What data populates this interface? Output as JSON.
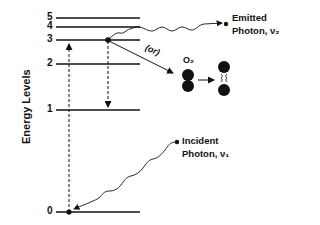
{
  "diagram": {
    "axis_label": "Energy Levels",
    "levels": [
      {
        "label": "5",
        "y": 18
      },
      {
        "label": "4",
        "y": 27
      },
      {
        "label": "3",
        "y": 40
      },
      {
        "label": "2",
        "y": 64
      },
      {
        "label": "1",
        "y": 110
      },
      {
        "label": "0",
        "y": 212
      }
    ],
    "emitted": {
      "line1": "Emitted",
      "line2": "Photon, ν₂"
    },
    "incident": {
      "line1": "Incident",
      "line2": "Photon, ν₁"
    },
    "or_label": "(or)",
    "molecule_label": "O₂",
    "colors": {
      "ink": "#111111",
      "background": "#ffffff"
    }
  }
}
